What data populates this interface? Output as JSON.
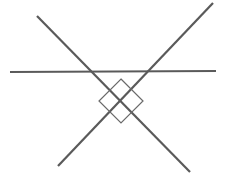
{
  "diagram": {
    "width": 240,
    "height": 185,
    "background": "#ffffff",
    "line_color": "#5a5a5a",
    "diamond_color": "#6a6a6a",
    "lines": [
      {
        "id": "horizontal",
        "x1": 10,
        "y1": 72,
        "x2": 216,
        "y2": 71,
        "stroke_width": 2.2
      },
      {
        "id": "diagonal-down",
        "x1": 37,
        "y1": 16,
        "x2": 190,
        "y2": 172,
        "stroke_width": 2.2
      },
      {
        "id": "diagonal-up",
        "x1": 213,
        "y1": 3,
        "x2": 58,
        "y2": 166,
        "stroke_width": 2.2
      }
    ],
    "diamond": {
      "cx": 121,
      "cy": 101,
      "half_diagonal": 22,
      "stroke_width": 1.2
    }
  }
}
